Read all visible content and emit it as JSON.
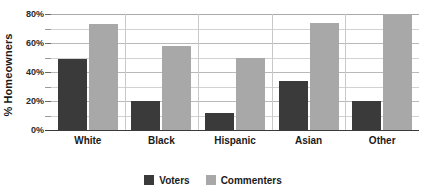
{
  "chart_data": {
    "type": "bar",
    "title": "",
    "subtitle": "",
    "xlabel": "",
    "ylabel": "% Homeowners",
    "categories": [
      "White",
      "Black",
      "Hispanic",
      "Asian",
      "Other"
    ],
    "series": [
      {
        "name": "Voters",
        "color": "#3a3a3a",
        "values": [
          49,
          20,
          12,
          34,
          20
        ]
      },
      {
        "name": "Commenters",
        "color": "#a8a8a8",
        "values": [
          73,
          58,
          50,
          74,
          79
        ]
      }
    ],
    "ylim": [
      0,
      80
    ],
    "y_ticks": [
      0,
      20,
      40,
      60,
      80
    ],
    "y_tick_labels": [
      "0%",
      "20%",
      "40%",
      "60%",
      "80%"
    ],
    "y_minor_ticks": [
      10,
      30,
      50,
      70
    ],
    "grid": true,
    "grid_axis": "y",
    "legend_position": "bottom",
    "legend_entries": [
      "Voters",
      "Commenters"
    ],
    "background_color": "#ffffff",
    "gridline_color": "#d2d2d2",
    "axis_color": "#3a3a3a"
  }
}
